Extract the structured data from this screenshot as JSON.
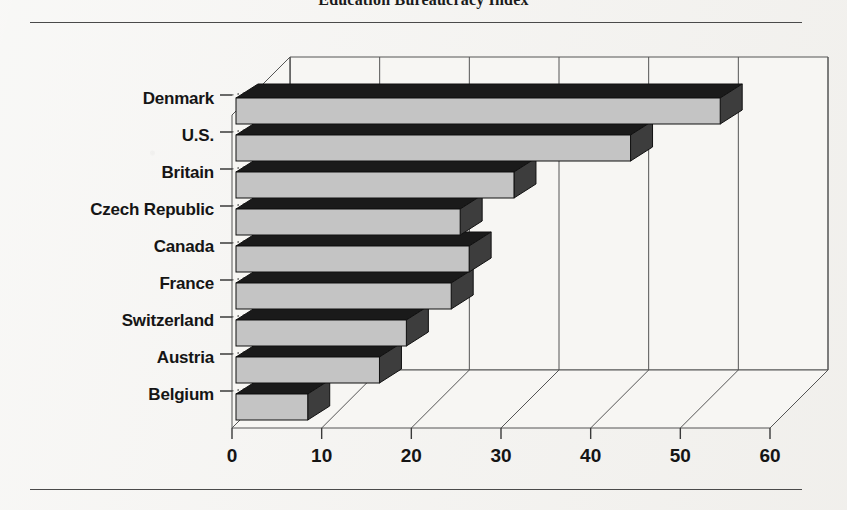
{
  "title": "Education Bureaucracy Index",
  "chart_data": {
    "type": "bar",
    "orientation": "horizontal",
    "style": "3d",
    "title": "Education Bureaucracy Index",
    "xlabel": "",
    "ylabel": "",
    "categories": [
      "Denmark",
      "U.S.",
      "Britain",
      "Czech Republic",
      "Canada",
      "France",
      "Switzerland",
      "Austria",
      "Belgium"
    ],
    "values": [
      54,
      44,
      31,
      25,
      26,
      24,
      19,
      16,
      8
    ],
    "xlim": [
      0,
      60
    ],
    "xticks": [
      0,
      10,
      20,
      30,
      40,
      50,
      60
    ],
    "xtick_labels": [
      "0",
      "10",
      "20",
      "30",
      "40",
      "50",
      "60"
    ],
    "grid": true,
    "legend": false,
    "bar_top_color": "#1a1a1a",
    "bar_face_color": "#c4c4c4",
    "bar_side_color": "#3d3d3d",
    "axis_color": "#555555",
    "background": "#f2f1ee"
  }
}
